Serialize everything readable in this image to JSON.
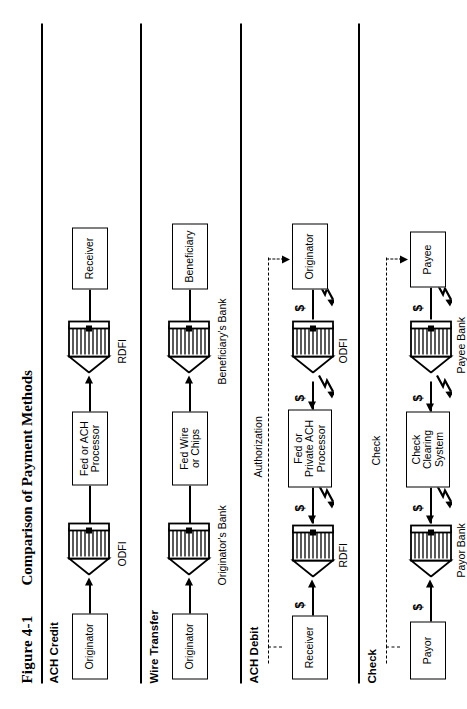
{
  "figure": {
    "number": "Figure 4-1",
    "title": "Comparison of Payment Methods"
  },
  "sections": [
    {
      "id": "ach-credit",
      "label": "ACH Credit",
      "nodes": {
        "start": "Originator",
        "start_bank": "ODFI",
        "middle": "Fed or ACH\nProcessor",
        "middle_line1": "Fed or ACH",
        "middle_line2": "Processor",
        "end_bank": "RDFI",
        "end": "Receiver"
      },
      "flow_direction": "forward",
      "has_dashed": false,
      "has_dollars": false,
      "has_zigzag": false
    },
    {
      "id": "wire-transfer",
      "label": "Wire Transfer",
      "nodes": {
        "start": "Originator",
        "start_bank": "Originator's Bank",
        "middle_line1": "Fed Wire",
        "middle_line2": "or Chips",
        "end_bank": "Beneficiary's Bank",
        "end": "Beneficiary"
      },
      "flow_direction": "forward",
      "has_dashed": false,
      "has_dollars": false,
      "has_zigzag": false
    },
    {
      "id": "ach-debit",
      "label": "ACH Debit",
      "nodes": {
        "start": "Receiver",
        "start_bank": "RDFI",
        "middle_line1": "Fed or",
        "middle_line2": "Private ACH",
        "middle_line3": "Processor",
        "end_bank": "ODFI",
        "end": "Originator"
      },
      "dashed_label": "Authorization",
      "flow_direction": "forward",
      "has_dashed": true,
      "has_dollars": true,
      "has_zigzag": true,
      "dollar_symbol": "$"
    },
    {
      "id": "check",
      "label": "Check",
      "nodes": {
        "start": "Payor",
        "start_bank": "Payor Bank",
        "middle_line1": "Check",
        "middle_line2": "Clearing",
        "middle_line3": "System",
        "end_bank": "Payee Bank",
        "end": "Payee"
      },
      "dashed_label": "Check",
      "flow_direction": "forward",
      "has_dashed": true,
      "has_dollars": true,
      "has_zigzag": true,
      "dollar_symbol": "$"
    }
  ],
  "colors": {
    "ink": "#000000",
    "paper": "#ffffff"
  }
}
